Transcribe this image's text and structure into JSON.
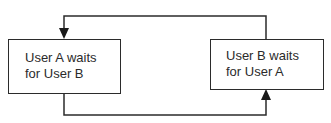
{
  "diagram": {
    "type": "deadlock-cycle",
    "nodes": [
      {
        "id": "A",
        "line1": "User A waits",
        "line2": "for User B"
      },
      {
        "id": "B",
        "line1": "User B waits",
        "line2": "for User A"
      }
    ],
    "edges": [
      {
        "from": "A",
        "to": "B",
        "route": "bottom",
        "arrow_at": "B"
      },
      {
        "from": "B",
        "to": "A",
        "route": "top",
        "arrow_at": "A"
      }
    ],
    "colors": {
      "stroke": "#2b2b2b",
      "background": "#ffffff"
    }
  }
}
